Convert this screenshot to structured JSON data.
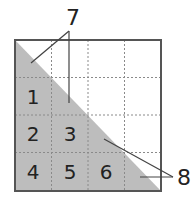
{
  "diagram": {
    "type": "grid-triangle-decomposition",
    "grid": {
      "rows": 4,
      "cols": 4,
      "x0": 15,
      "y0": 40,
      "x1": 161,
      "y1": 191
    },
    "colors": {
      "shade": "#bdbdbd",
      "border": "#555555",
      "grid_line": "#8a8a8a",
      "pointer": "#444444",
      "text": "#222222"
    },
    "cells": [
      {
        "label": "1",
        "row": 1,
        "col": 0
      },
      {
        "label": "2",
        "row": 2,
        "col": 0
      },
      {
        "label": "3",
        "row": 2,
        "col": 1
      },
      {
        "label": "4",
        "row": 3,
        "col": 0
      },
      {
        "label": "5",
        "row": 3,
        "col": 1
      },
      {
        "label": "6",
        "row": 3,
        "col": 2
      }
    ],
    "callouts": [
      {
        "label": "7",
        "description": "half-square triangles on diagonal (upper)"
      },
      {
        "label": "8",
        "description": "half-square triangles on diagonal (lower)"
      }
    ]
  }
}
